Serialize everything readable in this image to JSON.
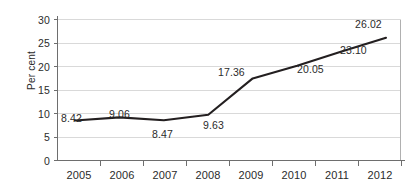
{
  "chart_data": {
    "type": "line",
    "title": "",
    "xlabel": "",
    "ylabel": "Per cent",
    "categories": [
      "2005",
      "2006",
      "2007",
      "2008",
      "2009",
      "2010",
      "2011",
      "2012"
    ],
    "values": [
      8.42,
      9.06,
      8.47,
      9.63,
      17.36,
      20.05,
      23.1,
      26.02
    ],
    "point_labels": [
      "8.42",
      "9.06",
      "8.47",
      "9.63",
      "17.36",
      "20.05",
      "23.10",
      "26.02"
    ],
    "ylim": [
      0,
      30
    ],
    "ytick_values": [
      0,
      5,
      10,
      15,
      20,
      25,
      30
    ],
    "ytick_labels": [
      "0",
      "5",
      "10",
      "15",
      "20",
      "25",
      "30"
    ],
    "grid": true,
    "grid_axis": "y",
    "legend": false,
    "markers": false,
    "series": [
      {
        "name": "Per cent",
        "values": [
          8.42,
          9.06,
          8.47,
          9.63,
          17.36,
          20.05,
          23.1,
          26.02
        ]
      }
    ],
    "colors": {
      "line": "#231f20",
      "grid": "#d9d9d9",
      "axis": "#808080",
      "text": "#2b2b2b",
      "background": "#ffffff"
    }
  },
  "axis": {
    "y_title": "Per cent"
  },
  "labels": {
    "y0": "0",
    "y5": "5",
    "y10": "10",
    "y15": "15",
    "y20": "20",
    "y25": "25",
    "y30": "30",
    "x2005": "2005",
    "x2006": "2006",
    "x2007": "2007",
    "x2008": "2008",
    "x2009": "2009",
    "x2010": "2010",
    "x2011": "2011",
    "x2012": "2012",
    "d2005": "8.42",
    "d2006": "9.06",
    "d2007": "8.47",
    "d2008": "9.63",
    "d2009": "17.36",
    "d2010": "20.05",
    "d2011": "23.10",
    "d2012": "26.02"
  }
}
